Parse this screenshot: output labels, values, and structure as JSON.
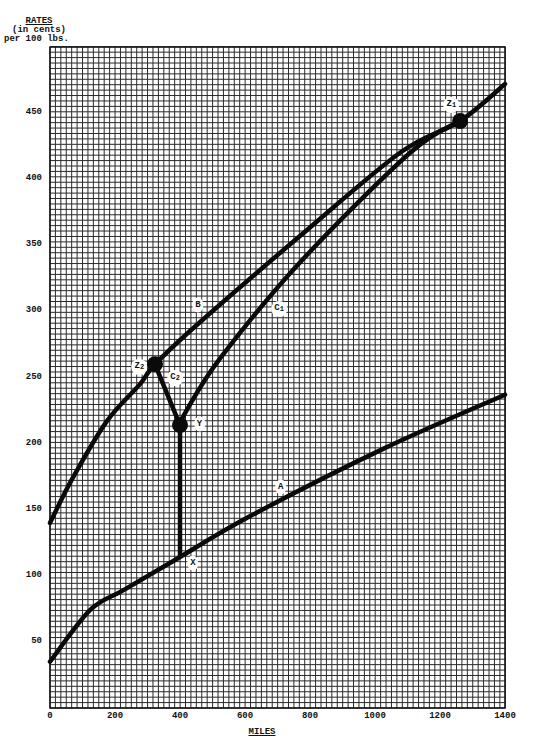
{
  "chart_data": {
    "type": "line",
    "title": "",
    "ylabel": [
      "RATES",
      "(in cents)",
      "per 100 lbs."
    ],
    "xlabel": "MILES",
    "xlim": [
      0,
      1400
    ],
    "ylim": [
      0,
      500
    ],
    "x_ticks": [
      0,
      200,
      400,
      600,
      800,
      1000,
      1200,
      1400
    ],
    "y_ticks": [
      50,
      100,
      150,
      200,
      250,
      300,
      350,
      400,
      450
    ],
    "grid": true,
    "series": [
      {
        "name": "A",
        "points": [
          [
            0,
            35
          ],
          [
            123,
            74
          ],
          [
            225,
            89
          ],
          [
            378,
            111
          ],
          [
            615,
            145
          ],
          [
            1025,
            196
          ],
          [
            1400,
            237
          ]
        ]
      },
      {
        "name": "B",
        "points": [
          [
            0,
            140
          ],
          [
            70,
            174
          ],
          [
            175,
            217
          ],
          [
            277,
            245
          ],
          [
            323,
            260
          ],
          [
            462,
            292
          ],
          [
            769,
            357
          ],
          [
            1077,
            420
          ],
          [
            1262,
            444
          ],
          [
            1400,
            472
          ]
        ]
      },
      {
        "name": "C1",
        "points": [
          [
            400,
            214
          ],
          [
            420,
            225
          ],
          [
            525,
            265
          ],
          [
            769,
            337
          ],
          [
            1108,
            420
          ],
          [
            1262,
            444
          ]
        ]
      },
      {
        "name": "C2",
        "points": [
          [
            323,
            260
          ],
          [
            400,
            214
          ]
        ]
      },
      {
        "name": "Y-X",
        "points": [
          [
            400,
            214
          ],
          [
            400,
            115
          ]
        ]
      }
    ],
    "annotations": [
      {
        "label": "A",
        "x": 710,
        "y": 167
      },
      {
        "label": "B",
        "x": 455,
        "y": 305
      },
      {
        "label": "C",
        "sub": "1",
        "x": 705,
        "y": 302
      },
      {
        "label": "C",
        "sub": "2",
        "x": 385,
        "y": 250
      },
      {
        "label": "Z",
        "sub": "2",
        "x": 275,
        "y": 258
      },
      {
        "label": "Y",
        "x": 460,
        "y": 215
      },
      {
        "label": "X",
        "x": 440,
        "y": 110
      },
      {
        "label": "Z",
        "sub": "1",
        "x": 1235,
        "y": 456
      }
    ],
    "markers": [
      {
        "name": "Z1",
        "x": 1262,
        "y": 444
      },
      {
        "name": "Z2",
        "x": 323,
        "y": 260
      },
      {
        "name": "Y",
        "x": 400,
        "y": 214
      }
    ]
  }
}
